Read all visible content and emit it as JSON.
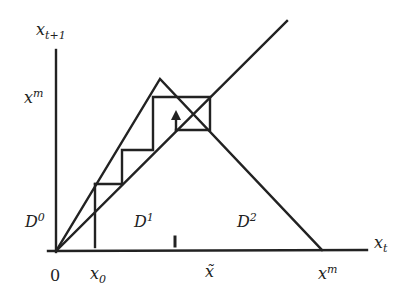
{
  "diagram": {
    "type": "cobweb_tent_map",
    "colors": {
      "stroke": "#222222",
      "background": "#ffffff"
    },
    "axes": {
      "y_label": {
        "base": "x",
        "sub": "t+1"
      },
      "x_label": {
        "base": "x",
        "sub": "t"
      },
      "origin_label": "0"
    },
    "y_ticks": [
      {
        "base": "x",
        "sup": "m"
      }
    ],
    "x_ticks": [
      {
        "base": "x",
        "sub": "0"
      },
      {
        "base": "x̃"
      },
      {
        "base": "x",
        "sup": "m"
      }
    ],
    "regions": [
      {
        "base": "D",
        "sup": "0"
      },
      {
        "base": "D",
        "sup": "1"
      },
      {
        "base": "D",
        "sup": "2"
      }
    ],
    "lines": [
      "45-degree line",
      "tent map",
      "cobweb staircase",
      "arrow"
    ]
  }
}
